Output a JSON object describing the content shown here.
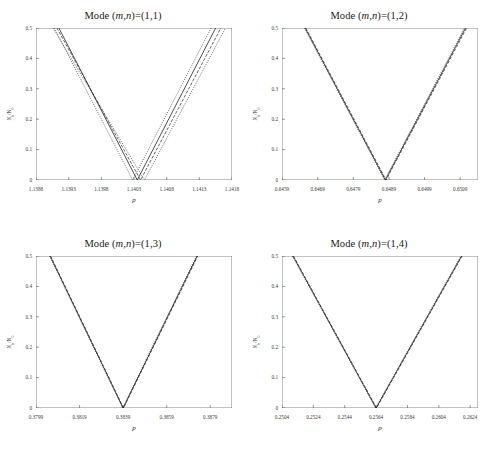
{
  "figure": {
    "xlabel": "p",
    "ylabel_main": "N",
    "ylabel_sub1": "b",
    "ylabel_slash": "/N",
    "ylabel_sub2": "0",
    "ytick_labels": [
      "0.5",
      "0.4",
      "0.3",
      "0.2",
      "0.1",
      "0"
    ],
    "title_prefix": "Mode (",
    "title_mn": "m,n",
    "title_eq": ")=("
  },
  "chart_data": [
    {
      "type": "line",
      "title": "Mode (m,n)=(1,1)",
      "mode": "(1,1)",
      "xlabel": "p",
      "ylabel": "Nb/N0",
      "xlim": [
        1.1388,
        1.1418
      ],
      "ylim": [
        0,
        0.5
      ],
      "xticks": [
        1.1388,
        1.1393,
        1.1398,
        1.1403,
        1.1408,
        1.1413,
        1.1418
      ],
      "xtick_labels": [
        "1.1388",
        "1.1393",
        "1.1398",
        "1.1403",
        "1.1408",
        "1.1413",
        "1.1418"
      ],
      "yticks": [
        0,
        0.1,
        0.2,
        0.3,
        0.4,
        0.5
      ],
      "grid": false,
      "legend": "none",
      "series": [
        {
          "name": "solid",
          "style": "solid",
          "vertex_x": 1.14035,
          "left_end_x": 1.13915,
          "right_end_x": 1.14155,
          "y_top": 0.5
        },
        {
          "name": "dashed",
          "style": "dashed",
          "vertex_x": 1.1404,
          "left_end_x": 1.13912,
          "right_end_x": 1.14163,
          "y_top": 0.5
        },
        {
          "name": "dotted-inner",
          "style": "dotted",
          "vertex_x": 1.14028,
          "left_end_x": 1.13908,
          "right_end_x": 1.14148,
          "y_top": 0.5
        },
        {
          "name": "dotted-outer",
          "style": "dotted",
          "vertex_x": 1.14046,
          "left_end_x": 1.13906,
          "right_end_x": 1.1417,
          "y_top": 0.5
        }
      ]
    },
    {
      "type": "line",
      "title": "Mode (m,n)=(1,2)",
      "mode": "(1,2)",
      "xlabel": "p",
      "ylabel": "Nb/N0",
      "xlim": [
        0.6459,
        0.6514
      ],
      "ylim": [
        0,
        0.5
      ],
      "xticks": [
        0.6459,
        0.6469,
        0.6479,
        0.6489,
        0.6499,
        0.6509
      ],
      "xtick_labels": [
        "0.6459",
        "0.6469",
        "0.6479",
        "0.6489",
        "0.6499",
        "0.6509"
      ],
      "yticks": [
        0,
        0.1,
        0.2,
        0.3,
        0.4,
        0.5
      ],
      "grid": false,
      "legend": "none",
      "series": [
        {
          "name": "solid",
          "style": "solid",
          "vertex_x": 0.6488,
          "left_end_x": 0.64655,
          "right_end_x": 0.65105,
          "y_top": 0.5
        },
        {
          "name": "dashed",
          "style": "dashed",
          "vertex_x": 0.64882,
          "left_end_x": 0.64657,
          "right_end_x": 0.65108,
          "y_top": 0.5
        },
        {
          "name": "dotted",
          "style": "dotted",
          "vertex_x": 0.64878,
          "left_end_x": 0.64653,
          "right_end_x": 0.65102,
          "y_top": 0.5
        }
      ]
    },
    {
      "type": "line",
      "title": "Mode (m,n)=(1,3)",
      "mode": "(1,3)",
      "xlabel": "p",
      "ylabel": "Nb/N0",
      "xlim": [
        0.3799,
        0.3889
      ],
      "ylim": [
        0,
        0.5
      ],
      "xticks": [
        0.3799,
        0.3819,
        0.3839,
        0.3859,
        0.3879
      ],
      "xtick_labels": [
        "0.3799",
        "0.3819",
        "0.3839",
        "0.3859",
        "0.3879"
      ],
      "yticks": [
        0,
        0.1,
        0.2,
        0.3,
        0.4,
        0.5
      ],
      "grid": false,
      "legend": "none",
      "series": [
        {
          "name": "solid",
          "style": "solid",
          "vertex_x": 0.3839,
          "left_end_x": 0.38055,
          "right_end_x": 0.3873,
          "y_top": 0.5
        },
        {
          "name": "dashed",
          "style": "dashed",
          "vertex_x": 0.38392,
          "left_end_x": 0.38057,
          "right_end_x": 0.38733,
          "y_top": 0.5
        },
        {
          "name": "dotted",
          "style": "dotted",
          "vertex_x": 0.38388,
          "left_end_x": 0.38052,
          "right_end_x": 0.38727,
          "y_top": 0.5
        }
      ]
    },
    {
      "type": "line",
      "title": "Mode (m,n)=(1,4)",
      "mode": "(1,4)",
      "xlabel": "p",
      "ylabel": "Nb/N0",
      "xlim": [
        0.2504,
        0.2629
      ],
      "ylim": [
        0,
        0.5
      ],
      "xticks": [
        0.2504,
        0.2524,
        0.2544,
        0.2564,
        0.2584,
        0.2604,
        0.2624
      ],
      "xtick_labels": [
        "0.2504",
        "0.2524",
        "0.2544",
        "0.2564",
        "0.2584",
        "0.2604",
        "0.2624"
      ],
      "yticks": [
        0,
        0.1,
        0.2,
        0.3,
        0.4,
        0.5
      ],
      "grid": false,
      "legend": "none",
      "series": [
        {
          "name": "solid",
          "style": "solid",
          "vertex_x": 0.2564,
          "left_end_x": 0.2511,
          "right_end_x": 0.26185,
          "y_top": 0.5
        },
        {
          "name": "dashed",
          "style": "dashed",
          "vertex_x": 0.25643,
          "left_end_x": 0.25113,
          "right_end_x": 0.26189,
          "y_top": 0.5
        },
        {
          "name": "dotted",
          "style": "dotted",
          "vertex_x": 0.25637,
          "left_end_x": 0.25106,
          "right_end_x": 0.26181,
          "y_top": 0.5
        }
      ]
    }
  ]
}
